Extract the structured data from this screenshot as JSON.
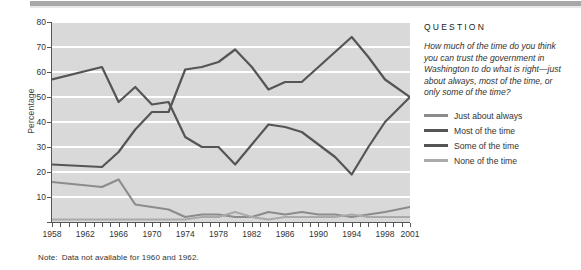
{
  "chart_data": {
    "type": "line",
    "title": "",
    "xlabel": "",
    "ylabel": "Percentage",
    "ylim": [
      0,
      80
    ],
    "yticks": [
      0,
      10,
      20,
      30,
      40,
      50,
      60,
      70,
      80
    ],
    "ytick_labels": [
      "",
      "10",
      "20",
      "30",
      "40",
      "50",
      "60",
      "70",
      "80"
    ],
    "xlim": [
      1958,
      2001
    ],
    "xtick_labels": [
      "1958",
      "1962",
      "1966",
      "1970",
      "1974",
      "1978",
      "1982",
      "1986",
      "1990",
      "1994",
      "1998",
      "2001"
    ],
    "xticks": [
      1958,
      1962,
      1966,
      1970,
      1974,
      1978,
      1982,
      1986,
      1990,
      1994,
      1998,
      2001
    ],
    "grid": "horizontal-white-on-gray",
    "legend_position": "right-panel",
    "note": "Data not available for 1960 and 1962.",
    "note_label": "Note:",
    "x": [
      1958,
      1964,
      1966,
      1968,
      1970,
      1972,
      1974,
      1976,
      1978,
      1980,
      1982,
      1984,
      1986,
      1988,
      1990,
      1992,
      1994,
      1996,
      1998,
      2001
    ],
    "series": [
      {
        "name": "Just about always",
        "color": "#8c8c8c",
        "values": [
          16,
          14,
          17,
          7,
          6,
          5,
          2,
          3,
          3,
          2,
          2,
          4,
          3,
          4,
          3,
          3,
          2,
          3,
          4,
          6
        ]
      },
      {
        "name": "Most of the time",
        "color": "#555555",
        "values": [
          57,
          62,
          48,
          54,
          47,
          48,
          34,
          30,
          30,
          23,
          31,
          39,
          38,
          36,
          31,
          26,
          19,
          30,
          40,
          50
        ]
      },
      {
        "name": "Some of the time",
        "color": "#555555",
        "values": [
          23,
          22,
          28,
          37,
          44,
          44,
          61,
          62,
          64,
          69,
          62,
          53,
          56,
          56,
          62,
          68,
          74,
          66,
          57,
          50
        ]
      },
      {
        "name": "None of the time",
        "color": "#aaaaaa",
        "values": [
          1,
          1,
          1,
          1,
          1,
          1,
          1,
          2,
          2,
          4,
          2,
          1,
          2,
          2,
          2,
          2,
          3,
          2,
          2,
          2
        ]
      }
    ]
  },
  "question": {
    "heading": "QUESTION",
    "text": "How much of the time do you think you can trust the government in Washington to do what is right—just about always, most of the time, or only some of the time?"
  },
  "legend": [
    {
      "label": "Just about always",
      "color": "#8c8c8c"
    },
    {
      "label": "Most of the time",
      "color": "#555555"
    },
    {
      "label": "Some of the time",
      "color": "#555555"
    },
    {
      "label": "None of the time",
      "color": "#aaaaaa"
    }
  ],
  "colors": {
    "plot_background": "#d9d9d9",
    "gridline": "#ffffff",
    "axis": "#555555",
    "topbar": "#a8a8a8"
  }
}
